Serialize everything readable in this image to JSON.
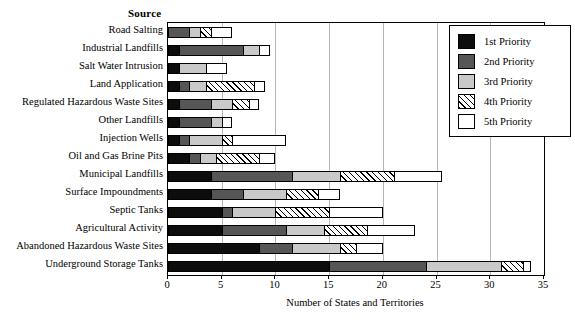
{
  "header": {
    "source_label": "Source"
  },
  "chart_data": {
    "type": "bar",
    "orientation": "horizontal",
    "stacked": true,
    "title": "",
    "xlabel": "Number of States and Territories",
    "ylabel": "Source",
    "xlim": [
      0,
      35
    ],
    "xticks": [
      0,
      5,
      10,
      15,
      20,
      25,
      30,
      35
    ],
    "grid": "vertical",
    "legend_position": "top-right",
    "categories": [
      "Road Salting",
      "Industrial Landfills",
      "Salt Water Intrusion",
      "Land Application",
      "Regulated Hazardous Waste Sites",
      "Other Landfills",
      "Injection Wells",
      "Oil and Gas Brine Pits",
      "Municipal Landfills",
      "Surface Impoundments",
      "Septic Tanks",
      "Agricultural Activity",
      "Abandoned Hazardous Waste Sites",
      "Underground Storage Tanks"
    ],
    "series": [
      {
        "name": "1st Priority",
        "color": "#0d0d0d",
        "values": [
          0,
          1,
          1,
          1,
          1,
          1,
          1,
          2,
          4,
          4,
          5,
          5,
          8.5,
          15
        ]
      },
      {
        "name": "2nd Priority",
        "color": "#565656",
        "values": [
          2,
          6,
          0,
          1,
          3,
          3,
          1,
          1,
          7.5,
          3,
          1,
          6,
          3,
          9
        ]
      },
      {
        "name": "3rd Priority",
        "color": "#c9c9c9",
        "values": [
          1,
          1.5,
          2.5,
          1.5,
          2,
          1,
          3,
          1.5,
          4.5,
          4,
          4,
          3.5,
          4.5,
          7
        ]
      },
      {
        "name": "4th Priority",
        "color": "hatched",
        "values": [
          1,
          0,
          0,
          4.5,
          1.5,
          0,
          1,
          4,
          5,
          3,
          5,
          4,
          1.5,
          2
        ]
      },
      {
        "name": "5th Priority",
        "color": "#ffffff",
        "values": [
          2,
          1,
          2,
          1,
          1,
          1,
          5,
          1.5,
          4.5,
          2,
          5,
          4.5,
          2.5,
          0.8
        ]
      }
    ],
    "totals": [
      6,
      9.5,
      5.5,
      9,
      8.5,
      6,
      11,
      10,
      25.5,
      16,
      20,
      23,
      20,
      33.8
    ]
  },
  "legend": {
    "items": [
      {
        "label": "1st Priority",
        "swatch": "p1"
      },
      {
        "label": "2nd Priority",
        "swatch": "p2"
      },
      {
        "label": "3rd Priority",
        "swatch": "p3"
      },
      {
        "label": "4th Priority",
        "swatch": "p4"
      },
      {
        "label": "5th Priority",
        "swatch": "p5"
      }
    ]
  },
  "axis": {
    "title": "Number of States and Territories",
    "tick_labels": [
      "0",
      "5",
      "10",
      "15",
      "20",
      "25",
      "30",
      "35"
    ]
  }
}
